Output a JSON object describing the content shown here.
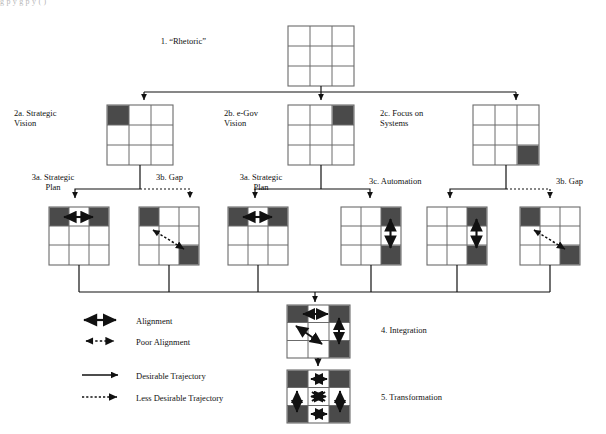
{
  "figure": {
    "caption_fragment": "g  p  y    g      p  y                ( )"
  },
  "nodes": {
    "rhetoric": {
      "id": "1",
      "label": "1. “Rhetoric”"
    },
    "strategic_vision": {
      "id": "2a",
      "label": "2a. Strategic\nVision"
    },
    "egov_vision": {
      "id": "2b",
      "label": "2b. e-Gov\nVision"
    },
    "focus_systems": {
      "id": "2c",
      "label": "2c. Focus on\nSystems"
    },
    "strategic_plan_left": {
      "id": "3a",
      "label": "3a. Strategic\nPlan"
    },
    "gap_left": {
      "id": "3b",
      "label": "3b. Gap"
    },
    "strategic_plan_mid": {
      "id": "3a",
      "label": "3a. Strategic\nPlan"
    },
    "automation": {
      "id": "3c",
      "label": "3c. Automation"
    },
    "gap_right": {
      "id": "3b",
      "label": "3b. Gap"
    },
    "integration": {
      "id": "4",
      "label": "4. Integration"
    },
    "transformation": {
      "id": "5",
      "label": "5. Transformation"
    }
  },
  "legend": {
    "items": [
      {
        "key": "alignment",
        "label": "Alignment",
        "style": "double-solid"
      },
      {
        "key": "poor-alignment",
        "label": "Poor Alignment",
        "style": "double-dotted"
      },
      {
        "key": "desirable-trajectory",
        "label": "Desirable Trajectory",
        "style": "single-solid"
      },
      {
        "key": "less-desirable-trajectory",
        "label": "Less Desirable Trajectory",
        "style": "single-dotted"
      }
    ]
  },
  "colors": {
    "fill_dark": "#4a4a4a",
    "fill_light": "#ffffff",
    "stroke": "#4a4a4a",
    "ink": "#111111"
  },
  "grids": {
    "rhetoric": {
      "shaded": []
    },
    "strategic_vision": {
      "shaded": [
        [
          0,
          0
        ]
      ]
    },
    "egov_vision": {
      "shaded": [
        [
          0,
          2
        ]
      ]
    },
    "focus_systems": {
      "shaded": [
        [
          2,
          2
        ]
      ]
    },
    "g3_1": {
      "shaded": [
        [
          0,
          0
        ],
        [
          0,
          2
        ]
      ],
      "arrow": "horizontal-solid"
    },
    "g3_2": {
      "shaded": [
        [
          0,
          0
        ],
        [
          2,
          2
        ]
      ],
      "arrow": "diagonal-dotted"
    },
    "g3_3": {
      "shaded": [
        [
          0,
          0
        ],
        [
          0,
          2
        ]
      ],
      "arrow": "horizontal-solid"
    },
    "g3_4": {
      "shaded": [
        [
          0,
          2
        ],
        [
          2,
          2
        ]
      ],
      "arrow": "vertical-solid"
    },
    "g3_5": {
      "shaded": [
        [
          0,
          2
        ],
        [
          2,
          2
        ]
      ],
      "arrow": "vertical-solid"
    },
    "g3_6": {
      "shaded": [
        [
          0,
          0
        ],
        [
          2,
          2
        ]
      ],
      "arrow": "diagonal-dotted"
    },
    "integration": {
      "shaded": [
        [
          0,
          0
        ],
        [
          0,
          2
        ],
        [
          2,
          2
        ]
      ],
      "arrows": [
        "horizontal-solid",
        "vertical-solid",
        "diagonal-solid"
      ]
    },
    "transformation": {
      "shaded": [
        [
          0,
          0
        ],
        [
          0,
          2
        ],
        [
          2,
          0
        ],
        [
          2,
          2
        ]
      ],
      "arrows": [
        "horizontal-top",
        "horizontal-bottom",
        "vertical-left",
        "vertical-right",
        "bowtie-center"
      ]
    }
  }
}
